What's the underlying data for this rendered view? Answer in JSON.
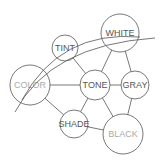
{
  "diagram": {
    "nodes": [
      {
        "id": "white",
        "label": "WHITE",
        "cx": 120,
        "cy": 33,
        "r": 19,
        "color": "#555555"
      },
      {
        "id": "tint",
        "label": "TINT",
        "cx": 65,
        "cy": 48,
        "r": 13,
        "color": "#555555"
      },
      {
        "id": "color",
        "label": "COLOR",
        "cx": 30,
        "cy": 85,
        "r": 20,
        "color": "#aaaaaa"
      },
      {
        "id": "tone",
        "label": "TONE",
        "cx": 95,
        "cy": 85,
        "r": 15,
        "color": "#555555"
      },
      {
        "id": "gray",
        "label": "GRAY",
        "cx": 135,
        "cy": 85,
        "r": 14,
        "color": "#555555"
      },
      {
        "id": "shade",
        "label": "SHADE",
        "cx": 74,
        "cy": 124,
        "r": 14,
        "color": "#555555"
      },
      {
        "id": "black",
        "label": "BLACK",
        "cx": 123,
        "cy": 134,
        "r": 20,
        "color": "#aaaaaa"
      }
    ],
    "edges": [
      [
        "tint",
        "tone"
      ],
      [
        "white",
        "tone"
      ],
      [
        "white",
        "gray"
      ],
      [
        "color",
        "tone"
      ],
      [
        "tone",
        "gray"
      ],
      [
        "tone",
        "shade"
      ],
      [
        "tone",
        "black"
      ],
      [
        "gray",
        "black"
      ],
      [
        "color",
        "shade"
      ],
      [
        "shade",
        "black"
      ]
    ],
    "arcs": [
      "M 15 112 Q 50 45 155 38",
      "M 22 100 Q 60 30 140 37"
    ]
  }
}
